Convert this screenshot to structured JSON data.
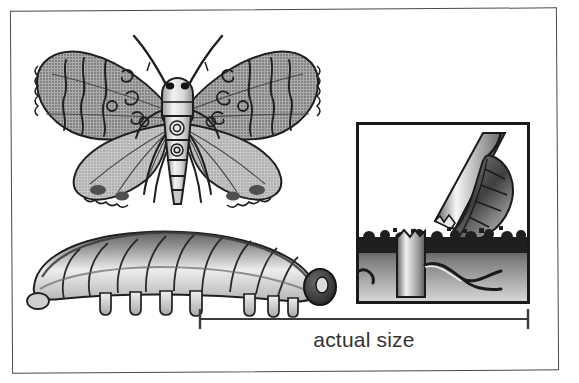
{
  "figure": {
    "caption": "actual size",
    "frame_color": "#4a4a4a",
    "background_color": "#ffffff",
    "ink_color": "#1a1a1a",
    "subjects": [
      {
        "name": "adult-moth",
        "label": "adult moth, wings spread, dorsal view"
      },
      {
        "name": "larva-caterpillar",
        "label": "caterpillar larva, lateral view"
      },
      {
        "name": "damage-inset",
        "label": "cut plant stem at soil line with leaf"
      }
    ]
  },
  "moth": {
    "name": "adult-moth",
    "wing_fill": "#b9b9b9",
    "hindwing_fill": "#d2d2d2",
    "body_fill": "#e3e3e3",
    "outline": "#1f1f1f",
    "antennae_count": 2,
    "wing_pairs": 2,
    "leg_pairs": 3,
    "abdomen_segments": 5,
    "wing_markings": "wavy transverse bands, scalloped fringe, dark spots"
  },
  "larva": {
    "name": "larva-caterpillar",
    "body_fill": "#c9c9c9",
    "highlight_fill": "#eaeaea",
    "shadow_fill": "#6f6f6f",
    "head_fill": "#3a3a3a",
    "outline": "#1f1f1f",
    "segments": 12,
    "proleg_count": 8,
    "orientation": "head at right, arched body"
  },
  "inset": {
    "name": "damage-inset",
    "border_color": "#1a1a1a",
    "sky_fill": "#ffffff",
    "stem_fill": "#9a9a9a",
    "stem_highlight": "#f2f2f2",
    "leaf_fill": "#5c5c5c",
    "soil_fill": "#2a2a2a",
    "subsoil_fill": "#8a8a8a",
    "elements": [
      "cut stem",
      "severed stump",
      "hanging leaf",
      "soil line",
      "roots"
    ]
  },
  "scale": {
    "name": "actual-size-scale",
    "label": "actual size",
    "line_color": "#3c3c3c",
    "tick_count": 2
  }
}
